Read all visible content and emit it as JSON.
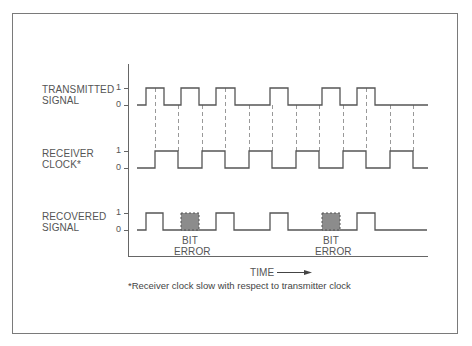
{
  "diagram": {
    "rows": [
      {
        "label_line1": "TRANSMITTED",
        "label_line2": "SIGNAL",
        "tick_high": "1",
        "tick_low": "0"
      },
      {
        "label_line1": "RECEIVER",
        "label_line2": "CLOCK*",
        "tick_high": "1",
        "tick_low": "0"
      },
      {
        "label_line1": "RECOVERED",
        "label_line2": "SIGNAL",
        "tick_high": "1",
        "tick_low": "0"
      }
    ],
    "bit_error_label_line1": "BIT",
    "bit_error_label_line2": "ERROR",
    "time_label": "TIME",
    "footnote": "*Receiver clock slow with respect to transmitter clock",
    "colors": {
      "line": "#555555",
      "dash": "#999999",
      "error_fill": "#8c8c8c",
      "frame": "#7a7a7a"
    }
  }
}
